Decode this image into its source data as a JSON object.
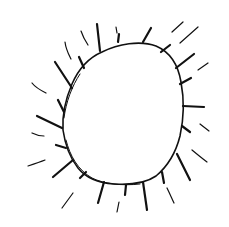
{
  "image": {
    "subject": "hand-drawn sun sketch",
    "background_color": "#ffffff",
    "stroke_color": "#111111",
    "width": 229,
    "height": 227
  }
}
